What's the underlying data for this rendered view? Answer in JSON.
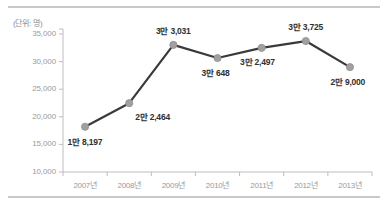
{
  "figure": {
    "unit_label": "(단위: 명)",
    "rule_color": "#c9c9c9",
    "background": "#ffffff"
  },
  "chart_data": {
    "type": "line",
    "title": "",
    "subtitle": "",
    "xlabel": "",
    "ylabel": "",
    "unit_note": "(단위: 명)",
    "categories": [
      "2007년",
      "2008년",
      "2009년",
      "2010년",
      "2011년",
      "2012년",
      "2013년"
    ],
    "values": [
      18197,
      22464,
      33031,
      30648,
      32497,
      33725,
      29000
    ],
    "point_labels": [
      "1만 8,197",
      "2만 2,464",
      "3만 3,031",
      "3만 648",
      "3만 2,497",
      "3만 3,725",
      "2만 9,000"
    ],
    "ylim": [
      10000,
      35000
    ],
    "yticks": [
      10000,
      15000,
      20000,
      25000,
      30000,
      35000
    ],
    "ytick_labels": [
      "10,000",
      "15,000",
      "20,000",
      "25,000",
      "30,000",
      "35,000"
    ],
    "grid": false,
    "legend": null,
    "legend_position": "none",
    "series": [
      {
        "name": "",
        "values": [
          18197,
          22464,
          33031,
          30648,
          32497,
          33725,
          29000
        ],
        "line_color": "#3a3a3a",
        "marker_color": "#a0a0a0",
        "marker_edge_color": "#8f8f8f"
      }
    ],
    "axis_color": "#bdbdbd",
    "tick_label_color": "#9a9a9a",
    "data_label_color": "#2f2f2f"
  }
}
